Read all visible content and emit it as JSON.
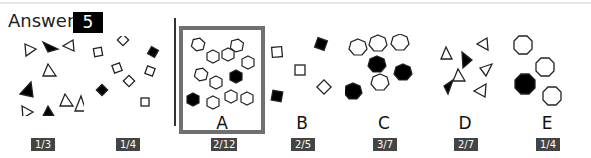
{
  "header": {
    "answer_label": "Answer",
    "answer_value": "5"
  },
  "colors": {
    "badge_bg": "#444444",
    "selected_border": "#707070",
    "shape_stroke": "#222222",
    "shape_fill_dark": "#000000"
  },
  "question_panels": [
    {
      "shape": "triangle",
      "total": 9,
      "filled": 3,
      "ratio_label": "1/3"
    },
    {
      "shape": "square",
      "total": 8,
      "filled": 2,
      "ratio_label": "1/4"
    }
  ],
  "options": [
    {
      "letter": "A",
      "shape": "hexagon",
      "total": 12,
      "filled": 2,
      "ratio_label": "2/12",
      "selected": true
    },
    {
      "letter": "B",
      "shape": "square",
      "total": 5,
      "filled": 2,
      "ratio_label": "2/5",
      "selected": false
    },
    {
      "letter": "C",
      "shape": "heptagon",
      "total": 7,
      "filled": 3,
      "ratio_label": "3/7",
      "selected": false
    },
    {
      "letter": "D",
      "shape": "triangle",
      "total": 7,
      "filled": 2,
      "ratio_label": "2/7",
      "selected": false
    },
    {
      "letter": "E",
      "shape": "octagon",
      "total": 4,
      "filled": 1,
      "ratio_label": "1/4",
      "selected": false
    }
  ]
}
